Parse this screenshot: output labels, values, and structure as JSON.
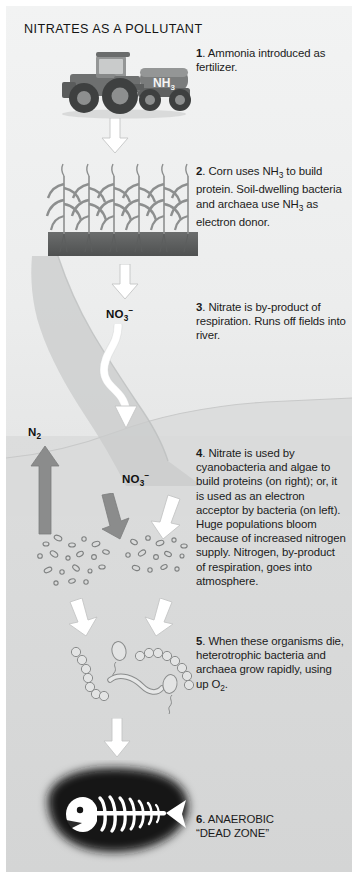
{
  "title": "NITRATES AS A POLLUTANT",
  "colors": {
    "background": "#e9eaea",
    "sky": "#f2f3f3",
    "water": "#d8d9d9",
    "white_arrow": "#ffffff",
    "gray_arrow": "#8b8c8c",
    "soil": "#6f7070",
    "corn": "#8d8f8f",
    "deadzone": "#121212",
    "skeleton": "#ffffff",
    "text": "#1b1b1b"
  },
  "steps": [
    {
      "number": "1.",
      "text": " Ammonia introduced as fertilizer.",
      "html": "<b>1</b>. Ammonia introduced as fertilizer."
    },
    {
      "number": "2.",
      "text": " Corn uses NH3 to build protein. Soil-dwelling bacteria and archaea use NH3 as electron donor.",
      "html": "<b>2</b>. Corn uses NH<sub>3</sub> to build protein. Soil-dwelling bacteria and archaea use NH<sub>3</sub> as electron donor."
    },
    {
      "number": "3.",
      "text": " Nitrate is by-product of respiration. Runs off fields into river.",
      "html": "<b>3</b>. Nitrate is by-product of respiration. Runs off fields into river."
    },
    {
      "number": "4.",
      "text": " Nitrate is used by cyanobacteria and algae to build proteins (on right); or, it is used as an electron acceptor by bacteria (on left). Huge populations bloom because of increased nitrogen supply. Nitrogen, by-product of respiration, goes into atmosphere.",
      "html": "<b>4</b>. Nitrate is used by cyanobacteria and algae to build proteins (on right); or, it is used as an electron acceptor by bacteria (on left). Huge populations bloom because of increased nitrogen supply. Nitrogen, by-product of respiration, goes into atmosphere."
    },
    {
      "number": "5.",
      "text": " When these organisms die, heterotrophic bacteria and archaea grow rapidly, using up O2.",
      "html": "<b>5</b>. When these organisms die, heterotrophic bacteria and archaea grow rapidly, using up O<sub>2</sub>."
    },
    {
      "number": "6.",
      "text": " ANAEROBIC “DEAD ZONE”",
      "html": "<b>6</b>. ANAEROBIC<br>“DEAD ZONE”"
    }
  ],
  "labels": {
    "tank": "NH3",
    "tank_html": "NH<sub>3</sub>",
    "nitrate_upper": "NO3-",
    "nitrate_upper_html": "NO<sub>3</sub><sup>−</sup>",
    "nitrate_lower": "NO3-",
    "nitrate_lower_html": "NO<sub>3</sub><sup>−</sup>",
    "dinitrogen": "N2",
    "dinitrogen_html": "N<sub>2</sub>"
  },
  "artwork": {
    "tractor": "tractor-with-ammonia-tank",
    "corn_field": "corn-plants-in-soil",
    "river": "river-flowing-to-sea",
    "bacteria_cluster_left": "bacteria-bloom-cluster",
    "algae_cluster_right": "cyanobacteria-algae-bloom-cluster",
    "dying_organisms": "dead-microorganisms",
    "dead_zone": "anaerobic-dead-zone-with-fish-skeleton"
  },
  "corn_plant_count": 6,
  "arrows": {
    "a1": "white-down-arrow",
    "a2": "white-down-arrow",
    "a3": "white-curved-runoff-arrow",
    "a4_gray": "gray-down-arrow",
    "a4_white": "white-down-arrow",
    "a5_left": "white-down-arrow",
    "a5_right": "white-down-arrow",
    "a6": "white-down-arrow",
    "n2": "gray-up-arrow"
  }
}
